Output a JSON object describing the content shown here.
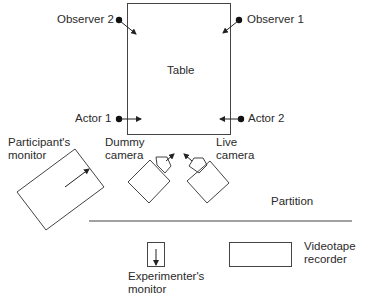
{
  "diagram": {
    "table": {
      "label": "Table"
    },
    "observers": [
      {
        "label": "Observer 2"
      },
      {
        "label": "Observer 1"
      }
    ],
    "actors": [
      {
        "label": "Actor 1"
      },
      {
        "label": "Actor 2"
      }
    ],
    "participant_monitor": {
      "line1": "Participant's",
      "line2": "monitor"
    },
    "dummy_camera": {
      "line1": "Dummy",
      "line2": "camera"
    },
    "live_camera": {
      "line1": "Live",
      "line2": "camera"
    },
    "partition": {
      "label": "Partition"
    },
    "experimenter_monitor": {
      "line1": "Experimenter's",
      "line2": "monitor"
    },
    "videotape_recorder": {
      "line1": "Videotape",
      "line2": "recorder"
    },
    "colors": {
      "stroke": "#3a3a3a",
      "text": "#2a2a2a"
    }
  }
}
